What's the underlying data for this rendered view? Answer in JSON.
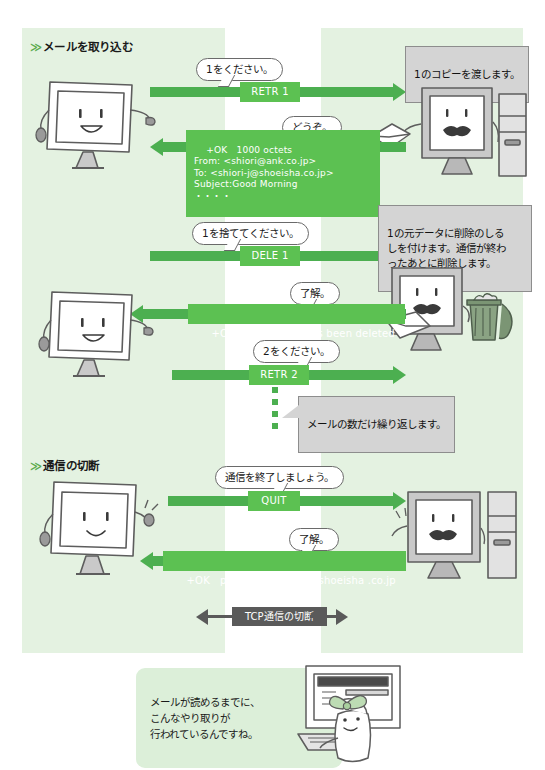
{
  "page": {
    "language": "ja",
    "colors": {
      "band_green": "#e4f2e1",
      "arrow_green": "#4caf50",
      "box_green": "#5cc152",
      "callout_grey": "#d4d4d4",
      "tcp_grey": "#5a5a5a",
      "callout_green": "#dcefd9"
    }
  },
  "sections": [
    {
      "chevron": "≫",
      "title": "メールを取り込む"
    },
    {
      "chevron": "≫",
      "title": "通信の切断"
    }
  ],
  "exchanges": {
    "retr1": {
      "bubble_client": "1をください。",
      "command": "RETR 1",
      "callout_server": "1のコピーを渡します。",
      "bubble_server": "どうぞ。",
      "response": "+OK   1000 octets\nFrom: <shiori@ank.co.jp>\nTo: <shiori-j@shoeisha.co.jp>\nSubject:Good Morning\n・・・・"
    },
    "dele1": {
      "bubble_client": "1を捨ててください。",
      "command": "DELE 1",
      "callout_server": "1の元データに削除のしる\nしを付けます。通信が終わ\nったあとに削除します。",
      "bubble_server": "了解。",
      "response": "+OK   message 1 has been deleted"
    },
    "retr2": {
      "bubble_client": "2をください。",
      "command": "RETR 2",
      "callout_repeat": "メールの数だけ繰り返します。"
    },
    "quit": {
      "bubble_client": "通信を終了しましょう。",
      "command": "QUIT",
      "bubble_server": "了解。",
      "response": "+OK   pop server at mail.shoeisha .co.jp"
    }
  },
  "tcp": {
    "label": "TCP通信の切断"
  },
  "summary": {
    "text": "メールが読めるまでに、\nこんなやり取りが\n行われているんですね。"
  },
  "characters": {
    "client_monitor_top": "client-monitor-smiling",
    "server_retr": "server-monitor-mustache",
    "server_dele": "server-monitor-mustache-envelope",
    "trash_can": "trash-can",
    "client_monitor_mid": "client-monitor-smiling",
    "client_monitor_quit": "client-monitor-smiling",
    "server_quit": "server-monitor-mustache",
    "user_person": "person-with-bow-at-computer"
  }
}
